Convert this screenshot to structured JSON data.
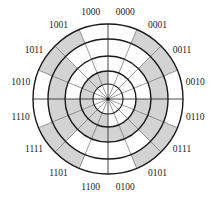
{
  "diagram": {
    "center": [
      108,
      99
    ],
    "radii": [
      15,
      28,
      43,
      60,
      75
    ],
    "label_radius": 89,
    "start_angle_deg": -90,
    "direction": "clockwise",
    "bit_ring_order": "innermost annulus = MSB, outermost annulus = LSB",
    "colors": {
      "shaded": "#d3d3d3",
      "blank": "#ffffff",
      "ring_line": "#1a1a1a",
      "spoke_line": "#555555",
      "label": "#222222"
    },
    "sectors": [
      {
        "code": "0000"
      },
      {
        "code": "0001"
      },
      {
        "code": "0011"
      },
      {
        "code": "0010"
      },
      {
        "code": "0110"
      },
      {
        "code": "0111"
      },
      {
        "code": "0101"
      },
      {
        "code": "0100"
      },
      {
        "code": "1100"
      },
      {
        "code": "1101"
      },
      {
        "code": "1111"
      },
      {
        "code": "1110"
      },
      {
        "code": "1010"
      },
      {
        "code": "1011"
      },
      {
        "code": "1001"
      },
      {
        "code": "1000"
      }
    ]
  }
}
